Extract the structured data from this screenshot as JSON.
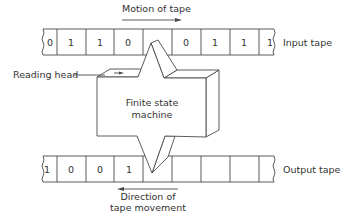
{
  "diagram": {
    "labels": {
      "motion_of_tape": "Motion of tape",
      "input_tape": "Input tape",
      "reading_head": "Reading head",
      "machine_line1": "Finite state",
      "machine_line2": "machine",
      "output_tape": "Output tape",
      "direction_line1": "Direction of",
      "direction_line2": "tape movement"
    },
    "input_tape": {
      "cells": [
        "0",
        "1",
        "1",
        "0",
        "",
        "0",
        "1",
        "1",
        "1"
      ]
    },
    "output_tape": {
      "cells": [
        "1",
        "0",
        "0",
        "1",
        "",
        "",
        "",
        "",
        ""
      ]
    },
    "arrows": {
      "motion_of_tape": "right",
      "direction_of_tape_movement": "left"
    },
    "colors": {
      "line": "#4a4a4a",
      "text": "#333333",
      "background": "#ffffff"
    }
  }
}
